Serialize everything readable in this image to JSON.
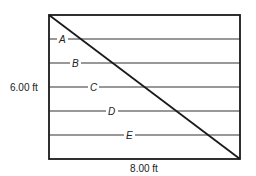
{
  "diagram": {
    "type": "rectangle-with-diagonal-and-parallel-lines",
    "colors": {
      "stroke": "#1a1a1a",
      "line": "#333333",
      "text": "#222222",
      "background": "#ffffff"
    },
    "rectangle": {
      "width_label": "8.00 ft",
      "height_label": "6.00 ft"
    },
    "lines": [
      {
        "label": "A"
      },
      {
        "label": "B"
      },
      {
        "label": "C"
      },
      {
        "label": "D"
      },
      {
        "label": "E"
      }
    ]
  }
}
